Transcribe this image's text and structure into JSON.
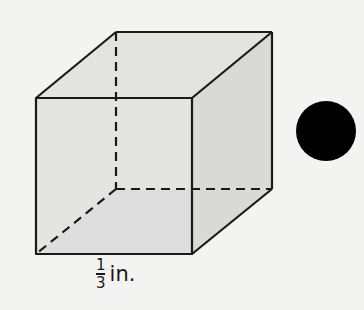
{
  "figure": {
    "type": "cube",
    "edge_label": {
      "numerator": "1",
      "denominator": "3",
      "unit": "in."
    },
    "colors": {
      "background": "#f3f3f2",
      "face_front": "#e1e1e0",
      "face_side": "#d9d9d8",
      "face_bottom": "#cfcfce",
      "edge": "#1a1a1a",
      "dot": "#000000"
    },
    "marker": "filled-circle"
  }
}
